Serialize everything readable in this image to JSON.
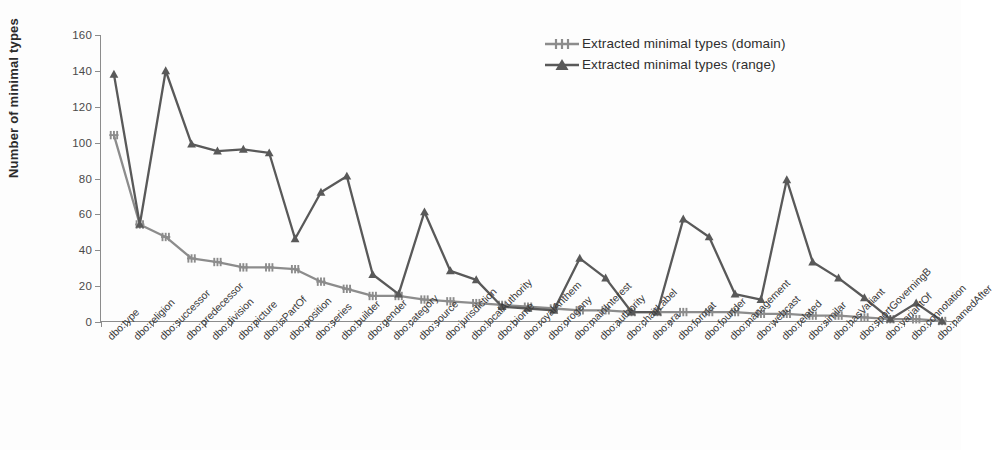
{
  "chart_data": {
    "type": "line",
    "title": "",
    "xlabel": "",
    "ylabel": "Number of minimal types",
    "ylim": [
      0,
      160
    ],
    "yticks": [
      0,
      20,
      40,
      60,
      80,
      100,
      120,
      140,
      160
    ],
    "grid": false,
    "legend_position": "top-right",
    "categories": [
      "dbo:type",
      "dbo:religion",
      "dbo:successor",
      "dbo:predecessor",
      "dbo:division",
      "dbo:picture",
      "dbo:isPartOf",
      "dbo:position",
      "dbo:series",
      "dbo:builder",
      "dbo:gender",
      "dbo:category",
      "dbo:source",
      "dbo:jurisdiction",
      "dbo:localAuthority",
      "dbo:biome",
      "dbo:royalAnthem",
      "dbo:orogeny",
      "dbo:mainInterest",
      "dbo:authority",
      "dbo:chairLabel",
      "dbo:era",
      "dbo:format",
      "dbo:founder",
      "dbo:management",
      "dbo:webcast",
      "dbo:related",
      "dbo:similar",
      "dbo:hasVariant",
      "dbo:sportGoverningB",
      "dbo:variantOf",
      "dbo:connotation",
      "dbo:namedAfter"
    ],
    "series": [
      {
        "name": "Extracted minimal types (domain)",
        "marker": "star",
        "color": "#8c8c8c",
        "values": [
          104,
          54,
          47,
          35,
          33,
          30,
          30,
          29,
          22,
          18,
          14,
          14,
          12,
          11,
          10,
          9,
          8,
          7,
          6,
          6,
          5,
          5,
          5,
          5,
          5,
          4,
          4,
          3,
          3,
          2,
          1,
          1,
          0
        ]
      },
      {
        "name": "Extracted minimal types (range)",
        "marker": "triangle",
        "color": "#595959",
        "values": [
          138,
          54,
          140,
          99,
          95,
          96,
          94,
          46,
          72,
          81,
          26,
          15,
          61,
          28,
          23,
          8,
          7,
          6,
          35,
          24,
          5,
          5,
          57,
          47,
          15,
          12,
          79,
          33,
          24,
          13,
          1,
          10,
          0
        ]
      }
    ]
  },
  "legend": {
    "items": [
      {
        "label": "Extracted minimal types (domain)",
        "marker": "star-marker-icon"
      },
      {
        "label": "Extracted minimal types (range)",
        "marker": "triangle-marker-icon"
      }
    ]
  },
  "axis": {
    "y_title": "Number of minimal types"
  }
}
